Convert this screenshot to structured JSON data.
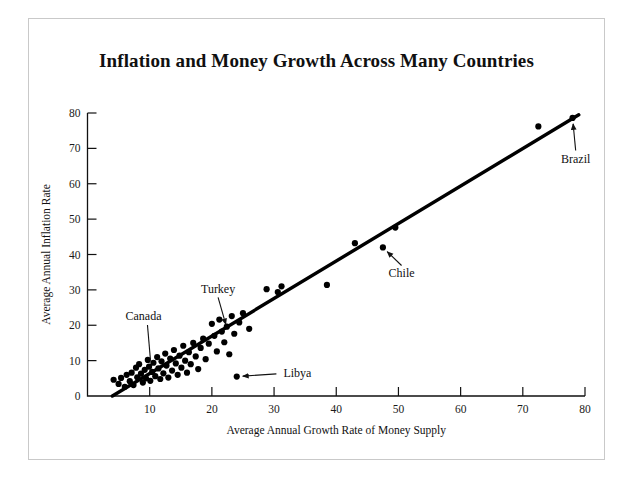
{
  "figure": {
    "title": "Inflation and Money Growth Across Many Countries",
    "background_color": "#ffffff",
    "frame_color": "#c9c9c9",
    "ink_color": "#000000"
  },
  "chart_data": {
    "type": "scatter",
    "title": "Inflation and Money Growth Across Many Countries",
    "subtitle": "",
    "xlabel": "Average Annual Growth Rate of Money Supply",
    "ylabel": "Average Annual Inflation Rate",
    "xlim": [
      0,
      80
    ],
    "ylim": [
      0,
      80
    ],
    "xticks": [
      0,
      10,
      20,
      30,
      40,
      50,
      60,
      70,
      80
    ],
    "yticks": [
      0,
      10,
      20,
      30,
      40,
      50,
      60,
      70,
      80
    ],
    "xtick_labels": [
      "0",
      "10",
      "20",
      "30",
      "40",
      "50",
      "60",
      "70",
      "80"
    ],
    "ytick_labels": [
      "0",
      "10",
      "20",
      "30",
      "40",
      "50",
      "60",
      "70",
      "80"
    ],
    "grid": false,
    "legend": "none",
    "marker": "filled-circle",
    "marker_color": "#000000",
    "points": [
      [
        4.2,
        4.6
      ],
      [
        5.0,
        3.4
      ],
      [
        5.4,
        5.1
      ],
      [
        6.0,
        2.6
      ],
      [
        6.3,
        6.0
      ],
      [
        6.8,
        4.2
      ],
      [
        7.1,
        6.6
      ],
      [
        7.4,
        3.1
      ],
      [
        7.8,
        8.0
      ],
      [
        8.0,
        5.3
      ],
      [
        8.3,
        9.0
      ],
      [
        8.6,
        6.3
      ],
      [
        8.9,
        3.8
      ],
      [
        9.2,
        7.4
      ],
      [
        9.4,
        5.0
      ],
      [
        9.7,
        10.2
      ],
      [
        9.9,
        8.3
      ],
      [
        10.1,
        4.3
      ],
      [
        10.4,
        6.8
      ],
      [
        10.6,
        9.4
      ],
      [
        10.9,
        5.6
      ],
      [
        11.2,
        11.0
      ],
      [
        11.4,
        7.8
      ],
      [
        11.7,
        4.8
      ],
      [
        11.9,
        9.8
      ],
      [
        12.2,
        6.4
      ],
      [
        12.5,
        12.0
      ],
      [
        12.7,
        8.6
      ],
      [
        13.0,
        5.2
      ],
      [
        13.3,
        10.6
      ],
      [
        13.6,
        7.2
      ],
      [
        13.9,
        13.0
      ],
      [
        14.2,
        9.2
      ],
      [
        14.5,
        6.0
      ],
      [
        14.8,
        11.4
      ],
      [
        15.1,
        8.0
      ],
      [
        15.4,
        14.2
      ],
      [
        15.7,
        10.0
      ],
      [
        16.0,
        6.6
      ],
      [
        16.3,
        12.4
      ],
      [
        16.6,
        9.0
      ],
      [
        17.0,
        15.0
      ],
      [
        17.4,
        11.2
      ],
      [
        17.8,
        7.6
      ],
      [
        18.2,
        13.6
      ],
      [
        18.6,
        16.2
      ],
      [
        19.0,
        10.4
      ],
      [
        19.5,
        14.8
      ],
      [
        20.0,
        20.4
      ],
      [
        20.4,
        17.0
      ],
      [
        20.8,
        12.6
      ],
      [
        21.2,
        21.6
      ],
      [
        21.6,
        18.2
      ],
      [
        22.0,
        15.2
      ],
      [
        22.4,
        19.6
      ],
      [
        22.8,
        11.8
      ],
      [
        23.2,
        22.6
      ],
      [
        23.6,
        17.6
      ],
      [
        24.0,
        5.5
      ],
      [
        24.4,
        20.8
      ],
      [
        25.0,
        23.4
      ],
      [
        26.0,
        19.0
      ],
      [
        28.8,
        30.2
      ],
      [
        30.6,
        29.4
      ],
      [
        31.2,
        31.0
      ],
      [
        38.5,
        31.4
      ],
      [
        43.0,
        43.2
      ],
      [
        47.5,
        42.0
      ],
      [
        49.5,
        47.6
      ],
      [
        72.5,
        76.2
      ],
      [
        78.0,
        78.6
      ]
    ],
    "trend_line": {
      "type": "linear-fit",
      "from": [
        4.0,
        0.0
      ],
      "to": [
        79.0,
        79.5
      ],
      "color": "#000000"
    },
    "annotations": [
      {
        "label": "Canada",
        "point": [
          10.2,
          8.6
        ],
        "text_xy": [
          9.0,
          21.5
        ],
        "style": "leader-line"
      },
      {
        "label": "Turkey",
        "point": [
          22.5,
          18.6
        ],
        "text_xy": [
          21.0,
          29.0
        ],
        "style": "down-arrow"
      },
      {
        "label": "Libya",
        "point": [
          24.0,
          5.5
        ],
        "text_xy": [
          31.5,
          5.4
        ],
        "style": "left-arrow"
      },
      {
        "label": "Chile",
        "point": [
          47.5,
          42.0
        ],
        "text_xy": [
          50.5,
          33.5
        ],
        "style": "up-left-arrow"
      },
      {
        "label": "Brazil",
        "point": [
          78.0,
          78.6
        ],
        "text_xy": [
          78.5,
          66.0
        ],
        "style": "up-arrow"
      }
    ]
  }
}
